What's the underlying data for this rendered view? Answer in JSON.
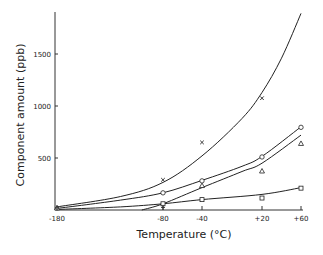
{
  "chart_data": {
    "type": "scatter",
    "title": "",
    "xlabel": "Temperature (°C)",
    "ylabel": "Component amount (ppb)",
    "x_ticks": [
      -180,
      -80,
      -40,
      20,
      60
    ],
    "x_tick_labels": [
      "-180",
      "-80",
      "-40",
      "+20",
      "+60"
    ],
    "y_ticks": [
      500,
      1000,
      1500
    ],
    "y_tick_labels": [
      "500",
      "1000",
      "1500"
    ],
    "ylim": [
      0,
      1900
    ],
    "grid": false,
    "legend": "none",
    "series": [
      {
        "name": "cross",
        "marker": "x",
        "points": [
          [
            -80,
            290
          ],
          [
            -40,
            650
          ],
          [
            20,
            1075
          ]
        ],
        "curve": [
          [
            -180,
            30
          ],
          [
            -120,
            130
          ],
          [
            -80,
            265
          ],
          [
            -40,
            520
          ],
          [
            0,
            880
          ],
          [
            20,
            1130
          ],
          [
            40,
            1460
          ],
          [
            60,
            1890
          ]
        ]
      },
      {
        "name": "circle",
        "marker": "o",
        "points": [
          [
            -80,
            165
          ],
          [
            -40,
            280
          ],
          [
            20,
            510
          ],
          [
            60,
            795
          ]
        ],
        "curve": [
          [
            -180,
            15
          ],
          [
            -120,
            95
          ],
          [
            -80,
            165
          ],
          [
            -40,
            285
          ],
          [
            0,
            420
          ],
          [
            20,
            515
          ],
          [
            60,
            800
          ]
        ]
      },
      {
        "name": "triangle",
        "marker": "triangle",
        "points": [
          [
            -180,
            20
          ],
          [
            -40,
            235
          ],
          [
            20,
            375
          ],
          [
            60,
            640
          ]
        ],
        "curve": [
          [
            -100,
            0
          ],
          [
            -80,
            60
          ],
          [
            -40,
            215
          ],
          [
            0,
            370
          ],
          [
            20,
            450
          ],
          [
            60,
            720
          ]
        ]
      },
      {
        "name": "square",
        "marker": "square",
        "points": [
          [
            -80,
            60
          ],
          [
            -40,
            100
          ],
          [
            20,
            115
          ],
          [
            60,
            210
          ]
        ],
        "curve": [
          [
            -180,
            5
          ],
          [
            -120,
            30
          ],
          [
            -80,
            60
          ],
          [
            -40,
            100
          ],
          [
            20,
            150
          ],
          [
            60,
            215
          ]
        ]
      },
      {
        "name": "plus",
        "marker": "+",
        "points": [
          [
            -180,
            20
          ],
          [
            -80,
            25
          ]
        ],
        "curve": []
      }
    ]
  }
}
